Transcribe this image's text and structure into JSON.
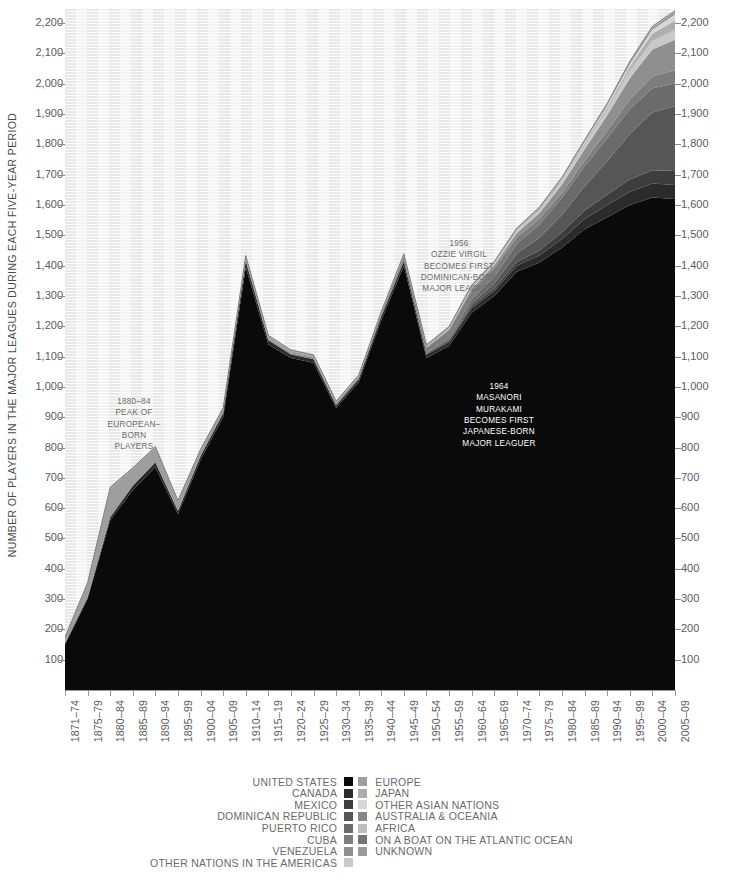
{
  "chart_data": {
    "type": "area",
    "title": "",
    "subtitle": "",
    "ylabel": "NUMBER OF PLAYERS IN THE MAJOR LEAGUES DURING EACH FIVE-YEAR PERIOD",
    "xlabel": "",
    "stacked": true,
    "grid": "vertical-bands-and-horizontal-rules",
    "legend_position": "bottom",
    "ylim": [
      0,
      2250
    ],
    "yticks": [
      "100",
      "200",
      "300",
      "400",
      "500",
      "600",
      "700",
      "800",
      "900",
      "1,000",
      "1,100",
      "1,200",
      "1,300",
      "1,400",
      "1,500",
      "1,600",
      "1,700",
      "1,800",
      "1,900",
      "2,000",
      "2,100",
      "2,200"
    ],
    "ytick_values": [
      100,
      200,
      300,
      400,
      500,
      600,
      700,
      800,
      900,
      1000,
      1100,
      1200,
      1300,
      1400,
      1500,
      1600,
      1700,
      1800,
      1900,
      2000,
      2100,
      2200
    ],
    "categories": [
      "1871-74",
      "1875-79",
      "1880-84",
      "1885-89",
      "1890-94",
      "1895-99",
      "1900-04",
      "1905-09",
      "1910-14",
      "1915-19",
      "1920-24",
      "1925-29",
      "1930-34",
      "1935-39",
      "1940-44",
      "1945-49",
      "1950-54",
      "1955-59",
      "1960-64",
      "1965-69",
      "1970-74",
      "1975-79",
      "1980-84",
      "1985-89",
      "1990-94",
      "1995-99",
      "2000-04",
      "2005-09"
    ],
    "series": [
      {
        "name": "UNITED STATES",
        "color": "#0a0a0a",
        "values": [
          150,
          300,
          560,
          660,
          735,
          580,
          760,
          900,
          1395,
          1140,
          1095,
          1080,
          930,
          1015,
          1220,
          1400,
          1095,
          1135,
          1245,
          1300,
          1380,
          1410,
          1460,
          1520,
          1560,
          1600,
          1625,
          1620
        ]
      },
      {
        "name": "CANADA",
        "color": "#2b2b2b",
        "values": [
          3,
          6,
          10,
          14,
          16,
          11,
          12,
          14,
          20,
          14,
          12,
          11,
          9,
          10,
          12,
          14,
          11,
          12,
          14,
          16,
          20,
          24,
          28,
          34,
          40,
          44,
          46,
          46
        ]
      },
      {
        "name": "MEXICO",
        "color": "#3d3d3d",
        "values": [
          0,
          0,
          0,
          0,
          0,
          0,
          0,
          0,
          0,
          0,
          0,
          0,
          0,
          0,
          1,
          2,
          3,
          5,
          7,
          9,
          12,
          16,
          22,
          28,
          34,
          40,
          44,
          46
        ]
      },
      {
        "name": "DOMINICAN REPUBLIC",
        "color": "#565656",
        "values": [
          0,
          0,
          0,
          0,
          0,
          0,
          0,
          0,
          0,
          0,
          0,
          0,
          0,
          0,
          0,
          0,
          0,
          2,
          8,
          16,
          28,
          42,
          58,
          80,
          110,
          150,
          190,
          215
        ]
      },
      {
        "name": "PUERTO RICO",
        "color": "#6b6b6b",
        "values": [
          0,
          0,
          0,
          0,
          0,
          0,
          0,
          0,
          0,
          0,
          0,
          0,
          0,
          0,
          0,
          2,
          4,
          8,
          14,
          22,
          32,
          44,
          56,
          66,
          76,
          82,
          80,
          74
        ]
      },
      {
        "name": "CUBA",
        "color": "#7d7d7d",
        "values": [
          0,
          0,
          0,
          0,
          0,
          0,
          0,
          0,
          2,
          3,
          4,
          5,
          5,
          6,
          8,
          12,
          16,
          24,
          30,
          28,
          22,
          18,
          16,
          18,
          24,
          32,
          40,
          44
        ]
      },
      {
        "name": "VENEZUELA",
        "color": "#8f8f8f",
        "values": [
          0,
          0,
          0,
          0,
          0,
          0,
          0,
          0,
          0,
          0,
          0,
          0,
          0,
          0,
          0,
          1,
          2,
          4,
          7,
          10,
          14,
          20,
          28,
          38,
          52,
          70,
          88,
          100
        ]
      },
      {
        "name": "OTHER NATIONS IN THE AMERICAS",
        "color": "#c9c9c9",
        "values": [
          0,
          0,
          0,
          0,
          0,
          0,
          0,
          0,
          0,
          0,
          0,
          0,
          0,
          0,
          0,
          0,
          1,
          2,
          3,
          5,
          7,
          9,
          12,
          16,
          20,
          26,
          30,
          34
        ]
      },
      {
        "name": "EUROPE",
        "color": "#9e9e9e",
        "values": [
          20,
          45,
          95,
          55,
          48,
          30,
          18,
          14,
          12,
          9,
          7,
          6,
          5,
          4,
          4,
          4,
          3,
          3,
          3,
          3,
          3,
          3,
          3,
          3,
          3,
          4,
          4,
          4
        ]
      },
      {
        "name": "JAPAN",
        "color": "#adadad",
        "values": [
          0,
          0,
          0,
          0,
          0,
          0,
          0,
          0,
          0,
          0,
          0,
          0,
          0,
          0,
          0,
          0,
          0,
          0,
          1,
          1,
          1,
          1,
          1,
          2,
          4,
          8,
          18,
          26
        ]
      },
      {
        "name": "OTHER ASIAN NATIONS",
        "color": "#d6d6d6",
        "values": [
          0,
          0,
          0,
          0,
          0,
          0,
          0,
          0,
          0,
          0,
          0,
          0,
          0,
          0,
          0,
          0,
          0,
          0,
          0,
          0,
          1,
          1,
          2,
          3,
          5,
          9,
          14,
          20
        ]
      },
      {
        "name": "AUSTRALIA & OCEANIA",
        "color": "#878787",
        "values": [
          0,
          0,
          0,
          0,
          0,
          0,
          0,
          0,
          1,
          1,
          1,
          1,
          1,
          1,
          1,
          1,
          1,
          1,
          1,
          1,
          1,
          2,
          2,
          3,
          4,
          5,
          6,
          7
        ]
      },
      {
        "name": "AFRICA",
        "color": "#bdbdbd",
        "values": [
          0,
          0,
          0,
          0,
          0,
          0,
          0,
          0,
          0,
          0,
          0,
          0,
          0,
          0,
          0,
          0,
          0,
          0,
          0,
          0,
          0,
          0,
          1,
          1,
          1,
          1,
          2,
          2
        ]
      },
      {
        "name": "ON A BOAT ON THE ATLANTIC OCEAN",
        "color": "#757575",
        "values": [
          0,
          0,
          0,
          0,
          0,
          0,
          0,
          0,
          0,
          0,
          0,
          0,
          0,
          0,
          0,
          0,
          0,
          0,
          0,
          0,
          0,
          0,
          0,
          0,
          0,
          0,
          0,
          0
        ]
      },
      {
        "name": "UNKNOWN",
        "color": "#9a9a9a",
        "values": [
          2,
          3,
          4,
          4,
          4,
          4,
          4,
          3,
          3,
          3,
          3,
          3,
          3,
          3,
          3,
          3,
          3,
          3,
          3,
          3,
          3,
          3,
          3,
          3,
          3,
          3,
          3,
          3
        ]
      }
    ],
    "annotations": [
      {
        "id": "anno-european-peak",
        "text": "1880-84\nPEAK OF\nEUROPEAN-\nBORN\nPLAYERS",
        "style": "dark",
        "x": 134,
        "y": 396
      },
      {
        "id": "anno-ozzie-virgil",
        "text": "1956\nOZZIE VIRGIL\nBECOMES FIRST\nDOMINICAN-BORN\nMAJOR LEAGUER",
        "style": "dark",
        "x": 459,
        "y": 238
      },
      {
        "id": "anno-masanori-murakami",
        "text": "1964\nMASANORI\nMURAKAMI\nBECOMES FIRST\nJAPANESE-BORN\nMAJOR LEAGUER",
        "style": "light",
        "x": 499,
        "y": 381
      }
    ]
  },
  "legend": {
    "column_a": [
      {
        "label": "UNITED STATES",
        "color": "#0a0a0a"
      },
      {
        "label": "CANADA",
        "color": "#2b2b2b"
      },
      {
        "label": "MEXICO",
        "color": "#3d3d3d"
      },
      {
        "label": "DOMINICAN REPUBLIC",
        "color": "#565656"
      },
      {
        "label": "PUERTO RICO",
        "color": "#6b6b6b"
      },
      {
        "label": "CUBA",
        "color": "#7d7d7d"
      },
      {
        "label": "VENEZUELA",
        "color": "#8f8f8f"
      },
      {
        "label": "OTHER NATIONS IN THE AMERICAS",
        "color": "#c9c9c9"
      }
    ],
    "column_b": [
      {
        "label": "EUROPE",
        "color": "#9e9e9e"
      },
      {
        "label": "JAPAN",
        "color": "#adadad"
      },
      {
        "label": "OTHER ASIAN NATIONS",
        "color": "#d6d6d6"
      },
      {
        "label": "AUSTRALIA & OCEANIA",
        "color": "#878787"
      },
      {
        "label": "AFRICA",
        "color": "#bdbdbd"
      },
      {
        "label": "ON A BOAT ON THE ATLANTIC OCEAN",
        "color": "#757575"
      },
      {
        "label": "UNKNOWN",
        "color": "#9a9a9a"
      }
    ]
  },
  "footer": {
    "text": ""
  }
}
